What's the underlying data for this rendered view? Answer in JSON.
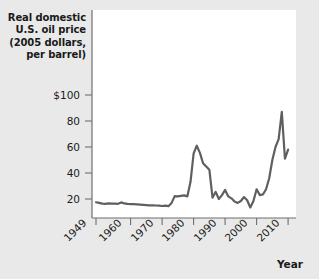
{
  "chart_data": {
    "type": "line",
    "title": "",
    "ylabel": "Real domestic U.S. oil price (2005 dollars, per barrel)",
    "ylabel_lines": [
      "Real domestic",
      "U.S. oil price",
      "(2005 dollars,",
      "per barrel)"
    ],
    "xlabel": "Year",
    "x": [
      1949,
      1950,
      1951,
      1952,
      1953,
      1954,
      1955,
      1956,
      1957,
      1958,
      1959,
      1960,
      1961,
      1962,
      1963,
      1964,
      1965,
      1966,
      1967,
      1968,
      1969,
      1970,
      1971,
      1972,
      1973,
      1974,
      1975,
      1976,
      1977,
      1978,
      1979,
      1980,
      1981,
      1982,
      1983,
      1984,
      1985,
      1986,
      1987,
      1988,
      1989,
      1990,
      1991,
      1992,
      1993,
      1994,
      1995,
      1996,
      1997,
      1998,
      1999,
      2000,
      2001,
      2002,
      2003,
      2004,
      2005,
      2006,
      2007,
      2008,
      2009,
      2010
    ],
    "values": [
      17.5,
      17.0,
      16.4,
      16.3,
      16.6,
      16.5,
      16.4,
      16.3,
      17.4,
      16.6,
      16.2,
      16.1,
      16.0,
      15.9,
      15.7,
      15.5,
      15.3,
      15.1,
      15.2,
      15.0,
      14.9,
      14.6,
      14.9,
      14.5,
      17.0,
      22.2,
      22.0,
      22.4,
      22.8,
      22.0,
      33.0,
      55.0,
      61.0,
      55.5,
      47.5,
      45.0,
      42.5,
      21.0,
      25.5,
      20.0,
      23.0,
      27.0,
      22.0,
      20.5,
      18.0,
      17.0,
      18.5,
      21.5,
      19.0,
      13.5,
      18.5,
      27.5,
      23.0,
      23.5,
      27.5,
      36.0,
      50.0,
      60.0,
      66.0,
      87.0,
      51.0,
      58.0
    ],
    "ylim": [
      5,
      110
    ],
    "yticks": [
      20,
      40,
      60,
      80,
      100
    ],
    "ytick_labels": [
      "20",
      "40",
      "60",
      "80",
      "$100"
    ],
    "xlim": [
      1949,
      2012
    ],
    "xticks": [
      1949,
      1960,
      1970,
      1980,
      1990,
      2000,
      2010
    ],
    "xtick_labels": [
      "1949",
      "1960",
      "1970",
      "1980",
      "1990",
      "2000",
      "2010"
    ],
    "grid": false,
    "legend": false,
    "line_color": "#5f5f5f",
    "plot_background": "#ffffff",
    "figure_background": "#e9e9e9"
  }
}
